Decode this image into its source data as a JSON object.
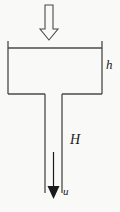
{
  "figure": {
    "background_color": "#f9f9f7",
    "line_color": "#4a4a4a",
    "arrow_fill_color": "#1a1a1a",
    "labels": {
      "tank_depth": "h",
      "pipe_length": "H",
      "exit_velocity": "u"
    },
    "icons": {
      "inflow_arrow": "block-arrow-down-icon",
      "outflow_arrow": "arrow-down-icon"
    }
  }
}
